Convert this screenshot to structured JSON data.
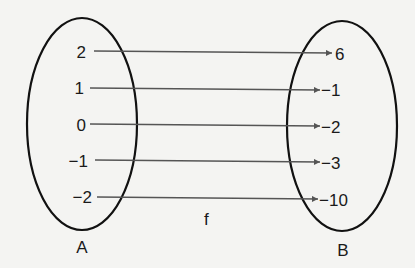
{
  "set_a": {
    "label": "A",
    "elements": [
      "2",
      "1",
      "0",
      "−1",
      "−2"
    ]
  },
  "set_b": {
    "label": "B",
    "elements": [
      "6",
      "−1",
      "−2",
      "−3",
      "−10"
    ]
  },
  "function_label": "f",
  "mappings": [
    {
      "from": "2",
      "to": "6"
    },
    {
      "from": "1",
      "to": "−1"
    },
    {
      "from": "0",
      "to": "−2"
    },
    {
      "from": "−1",
      "to": "−3"
    },
    {
      "from": "−2",
      "to": "−10"
    }
  ],
  "colors": {
    "ellipse": "#111111",
    "arrow": "#555555",
    "background": "#f4f4f2"
  }
}
